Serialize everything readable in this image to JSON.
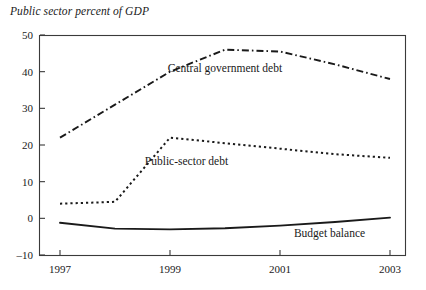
{
  "chart_data": {
    "type": "line",
    "title": "Public sector percent of GDP",
    "xlabel": "",
    "ylabel": "",
    "xlim": [
      1997,
      2003
    ],
    "ylim": [
      -10,
      50
    ],
    "yticks": [
      -10,
      0,
      10,
      20,
      30,
      40,
      50
    ],
    "ytick_labels": [
      "–10",
      "0",
      "10",
      "20",
      "30",
      "40",
      "50"
    ],
    "xticks": [
      1997,
      1999,
      2001,
      2003
    ],
    "xtick_labels": [
      "1997",
      "1999",
      "2001",
      "2003"
    ],
    "grid": false,
    "legend_position": "inline-annotations",
    "x": [
      1997,
      1998,
      1999,
      2000,
      2001,
      2002,
      2003
    ],
    "series": [
      {
        "name": "Central government debt",
        "style": "dash-dot",
        "values": [
          22,
          31,
          40,
          46,
          45.5,
          42,
          38
        ]
      },
      {
        "name": "Public-sector debt",
        "style": "dotted",
        "values": [
          4,
          4.5,
          22,
          20.5,
          19,
          17.5,
          16.5
        ]
      },
      {
        "name": "Budget balance",
        "style": "solid",
        "values": [
          -1.2,
          -2.8,
          -3,
          -2.7,
          -2,
          -1,
          0.2
        ]
      }
    ],
    "annotations": [
      {
        "text": "Central government debt",
        "x": 2000.0,
        "y": 40.0
      },
      {
        "text": "Public-sector debt",
        "x": 1999.3,
        "y": 14.5
      },
      {
        "text": "Budget balance",
        "x": 2001.9,
        "y": -5.2
      }
    ]
  }
}
